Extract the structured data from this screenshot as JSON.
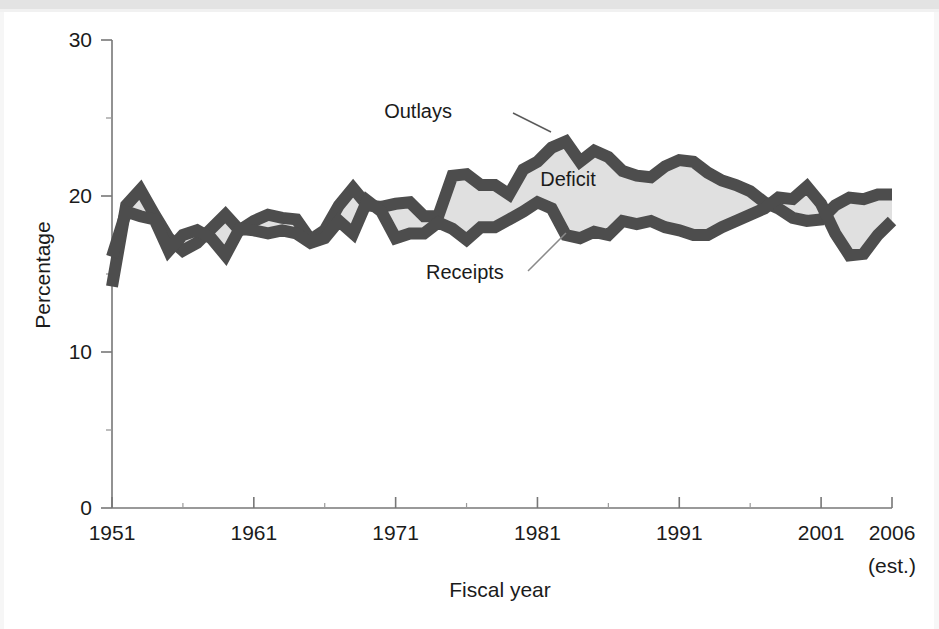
{
  "figure": {
    "background_color": "#ffffff",
    "band_color": "#e3e3e3"
  },
  "chart_data": {
    "type": "area",
    "title": "",
    "subtitle": "",
    "xlabel": "Fiscal year",
    "ylabel": "Percentage",
    "xlim": [
      1951,
      2006
    ],
    "ylim": [
      0,
      30
    ],
    "grid": false,
    "legend_position": "inline-annotation",
    "x_tick_labels": [
      "1951",
      "1961",
      "1971",
      "1981",
      "1991",
      "2001",
      "2006"
    ],
    "x_tick_values": [
      1951,
      1961,
      1971,
      1981,
      1991,
      2001,
      2006
    ],
    "x_tick_note": "(est.)",
    "x_minor_tick_values": [
      1956,
      1966,
      1976,
      1986,
      1996
    ],
    "y_tick_labels": [
      "0",
      "10",
      "20",
      "30"
    ],
    "y_tick_values": [
      0,
      10,
      20,
      30
    ],
    "y_minor_tick_values": [
      5,
      15,
      25
    ],
    "annotations": [
      {
        "name": "outlays-label",
        "text": "Outlays",
        "x_px": 452,
        "y_px": 118
      },
      {
        "name": "deficit-label",
        "text": "Deficit",
        "x_px": 568,
        "y_px": 186
      },
      {
        "name": "receipts-label",
        "text": "Receipts",
        "x_px": 426,
        "y_px": 279
      }
    ],
    "fill_label": "Deficit",
    "fill_color": "#e0e0e0",
    "line_color": "#4d4d4d",
    "line_width_units": 0.75,
    "x": [
      1951,
      1952,
      1953,
      1954,
      1955,
      1956,
      1957,
      1958,
      1959,
      1960,
      1961,
      1962,
      1963,
      1964,
      1965,
      1966,
      1967,
      1968,
      1969,
      1970,
      1971,
      1972,
      1973,
      1974,
      1975,
      1976,
      1977,
      1978,
      1979,
      1980,
      1981,
      1982,
      1983,
      1984,
      1985,
      1986,
      1987,
      1988,
      1989,
      1990,
      1991,
      1992,
      1993,
      1994,
      1995,
      1996,
      1997,
      1998,
      1999,
      2000,
      2001,
      2002,
      2003,
      2004,
      2005,
      2006
    ],
    "series": [
      {
        "name": "Outlays",
        "values": [
          14.2,
          19.4,
          20.4,
          18.8,
          17.3,
          16.5,
          17.0,
          17.9,
          18.8,
          17.8,
          18.4,
          18.8,
          18.6,
          18.5,
          17.2,
          17.8,
          19.4,
          20.5,
          19.4,
          19.3,
          19.5,
          19.6,
          18.7,
          18.7,
          21.3,
          21.4,
          20.7,
          20.7,
          20.1,
          21.7,
          22.2,
          23.1,
          23.5,
          22.2,
          22.9,
          22.5,
          21.6,
          21.3,
          21.2,
          21.9,
          22.3,
          22.2,
          21.5,
          21.0,
          20.7,
          20.3,
          19.6,
          19.2,
          18.6,
          18.4,
          18.5,
          19.4,
          19.9,
          19.8,
          20.1,
          20.1
        ]
      },
      {
        "name": "Receipts",
        "values": [
          16.1,
          19.0,
          18.7,
          18.5,
          16.5,
          17.5,
          17.8,
          17.3,
          16.2,
          17.9,
          17.8,
          17.6,
          17.8,
          17.6,
          17.0,
          17.3,
          18.4,
          17.6,
          19.7,
          19.0,
          17.3,
          17.6,
          17.6,
          18.3,
          17.9,
          17.2,
          18.0,
          18.0,
          18.5,
          19.0,
          19.6,
          19.2,
          17.5,
          17.3,
          17.7,
          17.5,
          18.4,
          18.2,
          18.4,
          18.0,
          17.8,
          17.5,
          17.5,
          18.0,
          18.4,
          18.8,
          19.2,
          19.9,
          19.8,
          20.6,
          19.5,
          17.6,
          16.2,
          16.3,
          17.5,
          18.4
        ]
      }
    ]
  },
  "axes": {
    "y_axis_title": "Percentage",
    "x_axis_title": "Fiscal year"
  }
}
